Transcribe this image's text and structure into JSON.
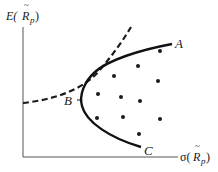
{
  "chart_data": {
    "type": "scatter",
    "title": "",
    "xlabel": "σ(R̃p)",
    "ylabel": "E(R̃p)",
    "grid": false,
    "legend": null,
    "points_label": "individual assets / portfolios",
    "points": [
      {
        "x": 160,
        "y": 51
      },
      {
        "x": 138,
        "y": 66
      },
      {
        "x": 114,
        "y": 76
      },
      {
        "x": 158,
        "y": 81
      },
      {
        "x": 98,
        "y": 94
      },
      {
        "x": 121,
        "y": 97
      },
      {
        "x": 140,
        "y": 101
      },
      {
        "x": 97,
        "y": 118
      },
      {
        "x": 123,
        "y": 117
      },
      {
        "x": 160,
        "y": 119
      },
      {
        "x": 139,
        "y": 134
      }
    ],
    "series": [
      {
        "name": "minimum-variance frontier",
        "style": "solid",
        "labels": [
          "A",
          "B",
          "C"
        ]
      },
      {
        "name": "indifference curve",
        "style": "dashed"
      }
    ],
    "annotations": [
      {
        "text": "A",
        "at": "upper end of frontier"
      },
      {
        "text": "B",
        "at": "minimum-variance point"
      },
      {
        "text": "C",
        "at": "lower end of frontier"
      }
    ]
  },
  "labels": {
    "y_axis_main": "E(",
    "y_axis_var": "R",
    "y_axis_sub": "p",
    "y_axis_close": ")",
    "x_axis_main": "σ(",
    "x_axis_var": "R",
    "x_axis_sub": "p",
    "x_axis_close": ")",
    "point_a": "A",
    "point_b": "B",
    "point_c": "C"
  },
  "colors": {
    "ink": "#1a1a1a",
    "axis": "#555555",
    "background": "#ffffff"
  }
}
